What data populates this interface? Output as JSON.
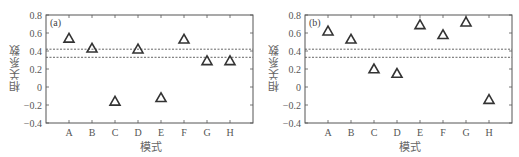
{
  "chart_data": [
    {
      "type": "scatter",
      "panel_label": "(a)",
      "title": "",
      "xlabel": "模式",
      "ylabel": "相关系数",
      "categories": [
        "A",
        "B",
        "C",
        "D",
        "E",
        "F",
        "G",
        "H"
      ],
      "values": [
        0.54,
        0.43,
        -0.16,
        0.42,
        -0.12,
        0.53,
        0.29,
        0.29
      ],
      "marker": "open-triangle",
      "ylim": [
        -0.4,
        0.8
      ],
      "yticks": [
        -0.4,
        -0.2,
        0,
        0.2,
        0.4,
        0.6,
        0.8
      ],
      "ytick_labels": [
        "−0.4",
        "−0.2",
        "0",
        "0.2",
        "0.4",
        "0.6",
        "0.8"
      ],
      "reference_lines": [
        {
          "y": 0.42,
          "style": "dashed"
        },
        {
          "y": 0.33,
          "style": "dashed"
        }
      ],
      "grid": false,
      "legend": null
    },
    {
      "type": "scatter",
      "panel_label": "(b)",
      "title": "",
      "xlabel": "模式",
      "ylabel": "相关系数",
      "categories": [
        "A",
        "B",
        "C",
        "D",
        "E",
        "F",
        "G",
        "H"
      ],
      "values": [
        0.62,
        0.53,
        0.2,
        0.15,
        0.69,
        0.58,
        0.72,
        -0.14
      ],
      "marker": "open-triangle",
      "ylim": [
        -0.4,
        0.8
      ],
      "yticks": [
        -0.4,
        -0.2,
        0,
        0.2,
        0.4,
        0.6,
        0.8
      ],
      "ytick_labels": [
        "−0.4",
        "−0.2",
        "0",
        "0.2",
        "0.4",
        "0.6",
        "0.8"
      ],
      "reference_lines": [
        {
          "y": 0.42,
          "style": "dashed"
        },
        {
          "y": 0.33,
          "style": "dashed"
        }
      ],
      "grid": false,
      "legend": null
    }
  ],
  "panels": {
    "a": {
      "tag": "(a)",
      "xlabel": "模式",
      "ylabel": "相关系数"
    },
    "b": {
      "tag": "(b)",
      "xlabel": "模式",
      "ylabel": "相关系数"
    }
  },
  "style": {
    "axis_color": "#555555",
    "marker_color": "#333333",
    "dash_color": "#555555"
  }
}
